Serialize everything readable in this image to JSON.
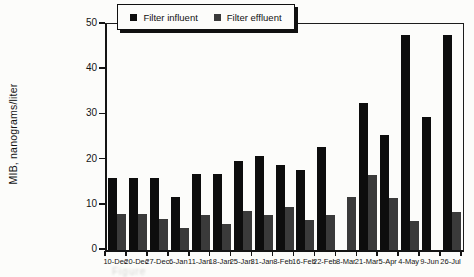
{
  "figure": {
    "background": "#fcfcfa",
    "caption_fragment": "Figure"
  },
  "chart_data": {
    "type": "bar",
    "title": "",
    "xlabel": "",
    "ylabel": "MIB, nanograms/liter",
    "ylim": [
      0,
      50
    ],
    "yticks": [
      0,
      10,
      20,
      30,
      40,
      50
    ],
    "grid": false,
    "legend_position": "top-center",
    "categories": [
      "10-Dec",
      "20-Dec",
      "27-Dec",
      "6-Jan",
      "11-Jan",
      "18-Jan",
      "25-Jan",
      "31-Jan",
      "8-Feb",
      "16-Feb",
      "22-Feb",
      "8-Mar",
      "21-Mar",
      "5-Apr",
      "4-May",
      "9-Jun",
      "26-Jul"
    ],
    "series": [
      {
        "name": "Filter influent",
        "color": "#0d0d0d",
        "values": [
          16,
          16,
          16,
          11.8,
          16.8,
          16.8,
          19.8,
          20.8,
          18.8,
          17.8,
          22.8,
          null,
          32.5,
          25.5,
          47.5,
          29.5,
          47.5
        ]
      },
      {
        "name": "Filter effluent",
        "color": "#3a3a3a",
        "values": [
          8,
          8,
          6.8,
          4.8,
          7.8,
          5.7,
          8.7,
          7.8,
          9.5,
          6.7,
          7.7,
          11.7,
          16.7,
          11.5,
          6.5,
          null,
          8.5
        ]
      }
    ]
  }
}
